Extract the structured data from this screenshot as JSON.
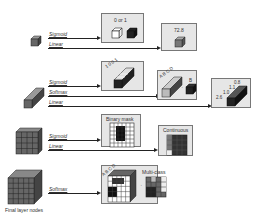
{
  "diagram": {
    "rows": [
      {
        "id": "scalar",
        "branches": [
          {
            "activation": "Sigmoid",
            "output_label": "0 or 1"
          },
          {
            "activation": "Linear",
            "output_label": "72.8"
          }
        ]
      },
      {
        "id": "vector",
        "branches": [
          {
            "activation": "Sigmoid",
            "output_label": "1 0 0 1"
          },
          {
            "activation": "Softmax",
            "output_label": "A B C D",
            "result": "B"
          },
          {
            "activation": "Linear",
            "output_label": "0.8 1.1 1.0 2.6"
          }
        ]
      },
      {
        "id": "matrix",
        "branches": [
          {
            "activation": "Sigmoid",
            "output_label": "Binary mask"
          },
          {
            "activation": "Linear",
            "output_label": "Continuous"
          }
        ]
      },
      {
        "id": "tensor",
        "branches": [
          {
            "activation": "Softmax",
            "output_label": "A B C D",
            "result": "Multi-class"
          }
        ]
      }
    ],
    "caption": "Final layer nodes",
    "labels": {
      "sigmoid": "Sigmoid",
      "linear": "Linear",
      "softmax": "Softmax",
      "zero_or_one": "0 or 1",
      "value_728": "72.8",
      "binary_digits": "1 0 0 1",
      "softmax_letters": "A B C D",
      "softmax_result": "B",
      "reg_v1": "0.8",
      "reg_v2": "1.1",
      "reg_v3": "1.0",
      "reg_v4": "2.6",
      "binary_mask": "Binary mask",
      "continuous": "Continuous",
      "multi_class": "Multi-class",
      "tensor_letters": "A B C D"
    },
    "colors": {
      "box_fill": "#e6e6e6",
      "box_border": "#777777",
      "cube_dark": "#222222",
      "cube_mid": "#777777",
      "line": "#222222"
    }
  }
}
